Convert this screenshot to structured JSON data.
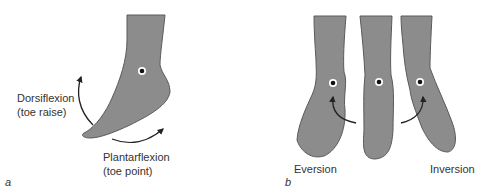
{
  "panels": [
    {
      "letter": "a",
      "labels": {
        "dorsiflexion": "Dorsiflexion",
        "dorsiflexion_sub": "(toe raise)",
        "plantarflexion": "Plantarflexion",
        "plantarflexion_sub": "(toe point)"
      }
    },
    {
      "letter": "b",
      "labels": {
        "eversion": "Eversion",
        "inversion": "Inversion"
      }
    }
  ],
  "colors": {
    "skin": "#8c8c8c",
    "outline": "#5a5a5a",
    "arrow": "#222222",
    "text": "#333333",
    "background": "#ffffff"
  }
}
